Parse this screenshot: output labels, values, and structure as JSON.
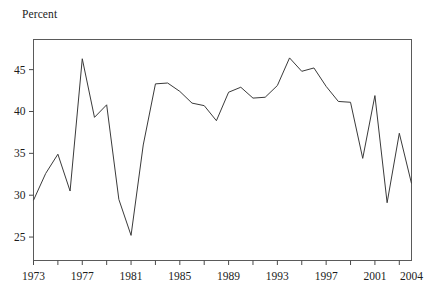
{
  "figure": {
    "axis_label_top": "Percent"
  },
  "chart_data": {
    "type": "line",
    "title": "",
    "subtitle": "",
    "xlabel": "",
    "ylabel": "Percent",
    "grid": false,
    "legend": null,
    "xlim": [
      1973,
      2004
    ],
    "ylim": [
      22.2,
      48.6
    ],
    "y_ticks": [
      25,
      30,
      35,
      40,
      45
    ],
    "y_tick_labels": [
      "25",
      "30",
      "35",
      "40",
      "45"
    ],
    "x_ticks": [
      1973,
      1975,
      1977,
      1979,
      1981,
      1983,
      1985,
      1987,
      1989,
      1991,
      1993,
      1995,
      1997,
      1999,
      2001,
      2003
    ],
    "x_tick_labels_shown": [
      "1973",
      "1977",
      "1981",
      "1985",
      "1989",
      "1993",
      "1997",
      "2001",
      "2004"
    ],
    "x_tick_label_values": [
      1973,
      1977,
      1981,
      1985,
      1989,
      1993,
      1997,
      2001,
      2004
    ],
    "series": [
      {
        "name": "Percent",
        "color": "#3a3a3a",
        "x": [
          1973,
          1974,
          1975,
          1976,
          1977,
          1978,
          1979,
          1980,
          1981,
          1982,
          1983,
          1984,
          1985,
          1986,
          1987,
          1988,
          1989,
          1990,
          1991,
          1992,
          1993,
          1994,
          1995,
          1996,
          1997,
          1998,
          1999,
          2000,
          2001,
          2002,
          2003,
          2004
        ],
        "values": [
          29.4,
          32.6,
          34.9,
          30.5,
          46.3,
          39.3,
          40.8,
          29.5,
          25.2,
          36.0,
          43.3,
          43.4,
          42.4,
          41.0,
          40.7,
          38.9,
          42.3,
          42.9,
          41.6,
          41.7,
          43.1,
          46.4,
          44.8,
          45.2,
          43.0,
          41.2,
          41.1,
          34.4,
          41.9,
          29.1,
          37.4,
          31.4
        ]
      }
    ]
  }
}
